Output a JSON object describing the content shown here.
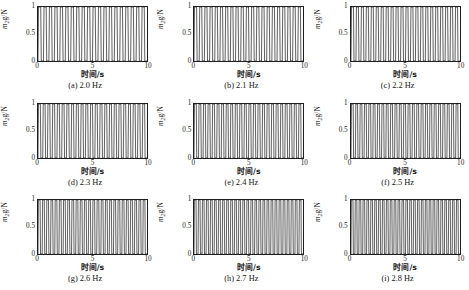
{
  "figure": {
    "axis_y_label_prefix": "m",
    "axis_y_label_sub": "2",
    "axis_y_label_suffix": "g/N",
    "axis_x_label": "时间/s",
    "y_ticks": [
      "0",
      "0.5",
      "1"
    ],
    "x_ticks": [
      "0",
      "5",
      "10"
    ],
    "line_color": "#1d1d1d",
    "background_color": "#ffffff"
  },
  "chart_data": {
    "type": "line",
    "title": "",
    "xlabel": "时间/s",
    "ylabel": "m2g/N",
    "xlim": [
      0,
      10
    ],
    "ylim": [
      0,
      1
    ],
    "grid": false,
    "legend": "none",
    "panels": [
      {
        "key": "a",
        "caption": "(a) 2.0 Hz",
        "frequency_hz": 2.0,
        "xlabel": "时间/s",
        "ylabel": "m2g/N",
        "x_ticks": [
          "0",
          "5",
          "10"
        ],
        "y_ticks": [
          "0",
          "0.5",
          "1"
        ],
        "xlim": [
          0,
          10
        ],
        "ylim": [
          0,
          1
        ],
        "envelope_min": 0.0,
        "envelope_max": 1.0,
        "cycles_visible": 20,
        "duty": 0.5,
        "waveform": "clipped-impact-oscillation"
      },
      {
        "key": "b",
        "caption": "(b) 2.1 Hz",
        "frequency_hz": 2.1,
        "xlabel": "时间/s",
        "ylabel": "m2g/N",
        "x_ticks": [
          "0",
          "5",
          "10"
        ],
        "y_ticks": [
          "0",
          "0.5",
          "1"
        ],
        "xlim": [
          0,
          10
        ],
        "ylim": [
          0,
          1
        ],
        "envelope_min": 0.0,
        "envelope_max": 1.0,
        "cycles_visible": 21,
        "duty": 0.5,
        "waveform": "clipped-impact-oscillation"
      },
      {
        "key": "c",
        "caption": "(c) 2.2 Hz",
        "frequency_hz": 2.2,
        "xlabel": "时间/s",
        "ylabel": "m2g/N",
        "x_ticks": [
          "0",
          "5",
          "10"
        ],
        "y_ticks": [
          "0",
          "0.5",
          "1"
        ],
        "xlim": [
          0,
          10
        ],
        "ylim": [
          0,
          1
        ],
        "envelope_min": 0.0,
        "envelope_max": 1.0,
        "cycles_visible": 22,
        "duty": 0.5,
        "waveform": "clipped-impact-oscillation"
      },
      {
        "key": "d",
        "caption": "(d) 2.3 Hz",
        "frequency_hz": 2.3,
        "xlabel": "时间/s",
        "ylabel": "m2g/N",
        "x_ticks": [
          "0",
          "5",
          "10"
        ],
        "y_ticks": [
          "0",
          "0.5",
          "1"
        ],
        "xlim": [
          0,
          10
        ],
        "ylim": [
          0,
          1
        ],
        "envelope_min": 0.0,
        "envelope_max": 1.0,
        "cycles_visible": 23,
        "duty": 0.5,
        "waveform": "clipped-impact-oscillation"
      },
      {
        "key": "e",
        "caption": "(e) 2.4 Hz",
        "frequency_hz": 2.4,
        "xlabel": "时间/s",
        "ylabel": "m2g/N",
        "x_ticks": [
          "0",
          "5",
          "10"
        ],
        "y_ticks": [
          "0",
          "0.5",
          "1"
        ],
        "xlim": [
          0,
          10
        ],
        "ylim": [
          0,
          1
        ],
        "envelope_min": 0.0,
        "envelope_max": 1.0,
        "cycles_visible": 24,
        "duty": 0.5,
        "waveform": "clipped-impact-oscillation"
      },
      {
        "key": "f",
        "caption": "(f) 2.5 Hz",
        "frequency_hz": 2.5,
        "xlabel": "时间/s",
        "ylabel": "m2g/N",
        "x_ticks": [
          "0",
          "5",
          "10"
        ],
        "y_ticks": [
          "0",
          "0.5",
          "1"
        ],
        "xlim": [
          0,
          10
        ],
        "ylim": [
          0,
          1
        ],
        "envelope_min": 0.0,
        "envelope_max": 1.0,
        "cycles_visible": 25,
        "duty": 0.5,
        "waveform": "clipped-impact-oscillation"
      },
      {
        "key": "g",
        "caption": "(g) 2.6 Hz",
        "frequency_hz": 2.6,
        "xlabel": "时间/s",
        "ylabel": "m2g/N",
        "x_ticks": [
          "0",
          "5",
          "10"
        ],
        "y_ticks": [
          "0",
          "0.5",
          "1"
        ],
        "xlim": [
          0,
          10
        ],
        "ylim": [
          0,
          1
        ],
        "envelope_min": 0.0,
        "envelope_max": 1.0,
        "cycles_visible": 26,
        "duty": 0.5,
        "waveform": "clipped-impact-oscillation"
      },
      {
        "key": "h",
        "caption": "(h) 2.7 Hz",
        "frequency_hz": 2.7,
        "xlabel": "时间/s",
        "ylabel": "m2g/N",
        "x_ticks": [
          "0",
          "5",
          "10"
        ],
        "y_ticks": [
          "0",
          "0.5",
          "1"
        ],
        "xlim": [
          0,
          10
        ],
        "ylim": [
          0,
          1
        ],
        "envelope_min": 0.0,
        "envelope_max": 1.0,
        "cycles_visible": 27,
        "duty": 0.5,
        "waveform": "clipped-impact-oscillation"
      },
      {
        "key": "i",
        "caption": "(i) 2.8 Hz",
        "frequency_hz": 2.8,
        "xlabel": "时间/s",
        "ylabel": "m2g/N",
        "x_ticks": [
          "0",
          "5",
          "10"
        ],
        "y_ticks": [
          "0",
          "0.5",
          "1"
        ],
        "xlim": [
          0,
          10
        ],
        "ylim": [
          0,
          1
        ],
        "envelope_min": 0.0,
        "envelope_max": 1.0,
        "cycles_visible": 28,
        "duty": 0.5,
        "waveform": "clipped-impact-oscillation"
      }
    ]
  }
}
